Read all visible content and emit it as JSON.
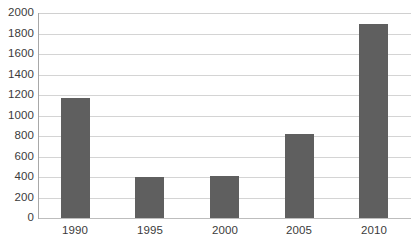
{
  "chart_data": {
    "type": "bar",
    "title": "",
    "subtitle": "",
    "xlabel": "",
    "ylabel": "",
    "categories": [
      "1990",
      "1995",
      "2000",
      "2005",
      "2010"
    ],
    "values": [
      1170,
      400,
      410,
      820,
      1890
    ],
    "series": [
      {
        "name": "",
        "values": [
          1170,
          400,
          410,
          820,
          1890
        ]
      }
    ],
    "ylim": [
      0,
      2000
    ],
    "y_ticks": [
      0,
      200,
      400,
      600,
      800,
      1000,
      1200,
      1400,
      1600,
      1800,
      2000
    ],
    "y_tick_labels": [
      "0",
      "200",
      "400",
      "600",
      "800",
      "1000",
      "1200",
      "1400",
      "1600",
      "1800",
      "2000"
    ],
    "grid": true,
    "grid_axis": "y",
    "legend": false,
    "legend_position": "none",
    "annotations": [],
    "colors": {
      "bar": "#5f5f5f",
      "gridline": "#d4d4d4",
      "axis_line": "#a8a8a8",
      "baseline": "#bdbdbd",
      "text": "#3b3b3b",
      "background": "#ffffff"
    }
  }
}
